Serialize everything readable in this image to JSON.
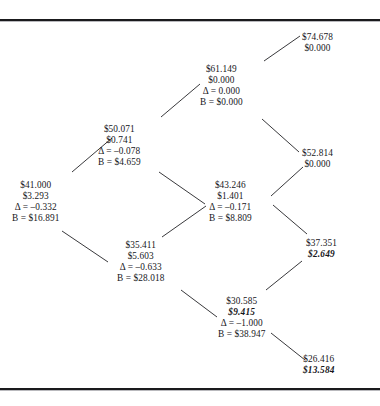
{
  "figure": {
    "kind": "binomial-option-pricing-lattice",
    "node_count": 9,
    "accent_color": "#16161a",
    "line_color": "#222226"
  },
  "chart_data": {
    "type": "diagram",
    "title": "",
    "xlabel": "",
    "ylabel": "",
    "nodes": [
      {
        "id": "n41",
        "price": "$41.000",
        "value": "$3.293",
        "value_accent": false,
        "delta": "Δ = –0.332",
        "bond": "B = $16.891",
        "x": 12,
        "y": 180
      },
      {
        "id": "n50",
        "price": "$50.071",
        "value": "$0.741",
        "value_accent": false,
        "delta": "Δ = –0.078",
        "bond": "B = $4.659",
        "x": 98,
        "y": 124
      },
      {
        "id": "n35",
        "price": "$35.411",
        "value": "$5.603",
        "value_accent": false,
        "delta": "Δ = –0.633",
        "bond": "B = $28.018",
        "x": 117,
        "y": 240
      },
      {
        "id": "n61",
        "price": "$61.149",
        "value": "$0.000",
        "value_accent": false,
        "delta": "Δ = 0.000",
        "bond": "B = $0.000",
        "x": 200,
        "y": 64
      },
      {
        "id": "n43",
        "price": "$43.246",
        "value": "$1.401",
        "value_accent": false,
        "delta": "Δ = –0.171",
        "bond": "B = $8.809",
        "x": 209,
        "y": 180
      },
      {
        "id": "n30",
        "price": "$30.585",
        "value": "$9.415",
        "value_accent": true,
        "delta": "Δ = –1.000",
        "bond": "B = $38.947",
        "x": 218,
        "y": 296
      },
      {
        "id": "n74",
        "price": "$74.678",
        "value": "$0.000",
        "value_accent": false,
        "delta": "",
        "bond": "",
        "x": 302,
        "y": 32
      },
      {
        "id": "n52",
        "price": "$52.814",
        "value": "$0.000",
        "value_accent": false,
        "delta": "",
        "bond": "",
        "x": 302,
        "y": 148
      },
      {
        "id": "n37",
        "price": "$37.351",
        "value": "$2.649",
        "value_accent": true,
        "delta": "",
        "bond": "",
        "x": 306,
        "y": 238
      },
      {
        "id": "n26",
        "price": "$26.416",
        "value": "$13.584",
        "value_accent": true,
        "delta": "",
        "bond": "",
        "x": 303,
        "y": 354
      }
    ],
    "edges": [
      {
        "from": "n41",
        "to": "n50",
        "x1": 72,
        "y1": 172,
        "x2": 112,
        "y2": 138
      },
      {
        "from": "n41",
        "to": "n35",
        "x1": 62,
        "y1": 231,
        "x2": 108,
        "y2": 262
      },
      {
        "from": "n50",
        "to": "n61",
        "x1": 161,
        "y1": 117,
        "x2": 200,
        "y2": 84
      },
      {
        "from": "n50",
        "to": "n43",
        "x1": 159,
        "y1": 172,
        "x2": 205,
        "y2": 204
      },
      {
        "from": "n35",
        "to": "n43",
        "x1": 162,
        "y1": 237,
        "x2": 206,
        "y2": 206
      },
      {
        "from": "n35",
        "to": "n30",
        "x1": 181,
        "y1": 290,
        "x2": 217,
        "y2": 317
      },
      {
        "from": "n61",
        "to": "n74",
        "x1": 264,
        "y1": 61,
        "x2": 300,
        "y2": 36
      },
      {
        "from": "n61",
        "to": "n52",
        "x1": 262,
        "y1": 119,
        "x2": 299,
        "y2": 152
      },
      {
        "from": "n43",
        "to": "n52",
        "x1": 271,
        "y1": 196,
        "x2": 303,
        "y2": 167
      },
      {
        "from": "n43",
        "to": "n37",
        "x1": 273,
        "y1": 205,
        "x2": 307,
        "y2": 234
      },
      {
        "from": "n30",
        "to": "n37",
        "x1": 266,
        "y1": 290,
        "x2": 302,
        "y2": 261
      },
      {
        "from": "n30",
        "to": "n26",
        "x1": 271,
        "y1": 333,
        "x2": 305,
        "y2": 360
      }
    ]
  }
}
